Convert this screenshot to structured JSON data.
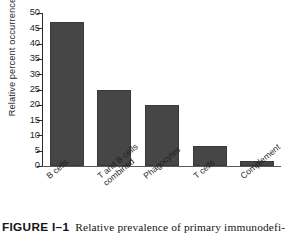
{
  "figure": {
    "label": "FIGURE I–1",
    "caption_text": "Relative prevalence of primary immunodefi-"
  },
  "chart_data": {
    "type": "bar",
    "title": "",
    "xlabel": "",
    "ylabel": "Relative percent occurrence",
    "categories": [
      "B cells",
      "T and B cells combined",
      "Phagocytes",
      "T cells",
      "Complement"
    ],
    "category_lines": [
      [
        "B cells"
      ],
      [
        "T and B cells",
        "combined"
      ],
      [
        "Phagocytes"
      ],
      [
        "T cells"
      ],
      [
        "Complement"
      ]
    ],
    "values": [
      47,
      25,
      20,
      6.5,
      1.5
    ],
    "ylim": [
      0,
      50
    ],
    "yticks": [
      0,
      5,
      10,
      15,
      20,
      25,
      30,
      35,
      40,
      45,
      50
    ],
    "ytick_labels": [
      "0",
      "5",
      "10",
      "15",
      "20",
      "25",
      "30",
      "35",
      "40",
      "45",
      "50"
    ],
    "grid": false,
    "legend": false,
    "bar_color": "#464646",
    "bar_edge_color": "#3a3a3a",
    "axis_color": "#2a2a2a",
    "background": "#ffffff"
  }
}
